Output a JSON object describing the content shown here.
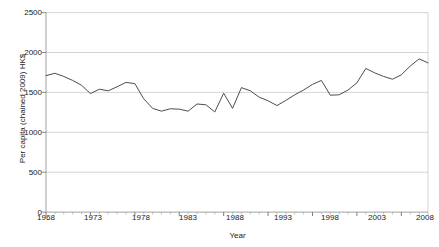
{
  "chart_data": {
    "type": "line",
    "title": "",
    "xlabel": "Year",
    "ylabel": "Per capita (chained 2009) HK$",
    "xlim": [
      1968,
      2011
    ],
    "ylim": [
      0,
      2500
    ],
    "grid": true,
    "legend": null,
    "y_ticks": [
      0,
      500,
      1000,
      1500,
      2000,
      2500
    ],
    "y_tick_labels": [
      "0",
      "500",
      "1000",
      "1500",
      "2000",
      "2500"
    ],
    "x_ticks": [
      1968,
      1973,
      1978,
      1983,
      1988,
      1993,
      1998,
      2003,
      2008
    ],
    "x_tick_labels": [
      "1968",
      "1973",
      "1978",
      "1983",
      "1988",
      "1993",
      "1998",
      "2003",
      "2008"
    ],
    "x_minor_tick_step": 1,
    "line_color": "#4d4d4d",
    "series": [
      {
        "name": "Per capita consumption",
        "x": [
          1968,
          1969,
          1970,
          1971,
          1972,
          1973,
          1974,
          1975,
          1976,
          1977,
          1978,
          1979,
          1980,
          1981,
          1982,
          1983,
          1984,
          1985,
          1986,
          1987,
          1988,
          1989,
          1990,
          1991,
          1992,
          1993,
          1994,
          1995,
          1996,
          1997,
          1998,
          1999,
          2000,
          2001,
          2002,
          2003,
          2004,
          2005,
          2006,
          2007,
          2008,
          2009,
          2010,
          2011
        ],
        "values": [
          1710,
          1740,
          1700,
          1650,
          1590,
          1485,
          1540,
          1520,
          1570,
          1625,
          1610,
          1420,
          1300,
          1265,
          1295,
          1290,
          1265,
          1355,
          1345,
          1255,
          1490,
          1300,
          1560,
          1520,
          1440,
          1395,
          1335,
          1400,
          1470,
          1530,
          1600,
          1650,
          1465,
          1470,
          1530,
          1620,
          1800,
          1745,
          1700,
          1665,
          1720,
          1830,
          1920,
          1870
        ]
      }
    ]
  },
  "axes": {
    "x_axis_label": "Year",
    "y_axis_label": "Per capita (chained 2009) HK$"
  },
  "title_fragment": ""
}
